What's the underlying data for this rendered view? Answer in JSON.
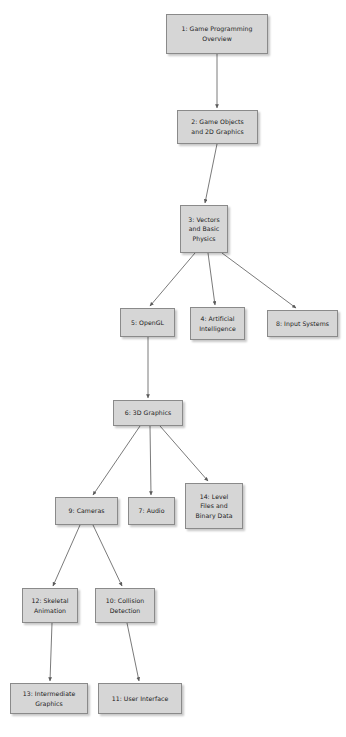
{
  "diagram": {
    "background_color": "#ffffff",
    "node_fill_color": "#d6d6d6",
    "node_border_color": "#8a8a8a",
    "edge_color": "#6b6b6b",
    "text_color": "#1b1b1b",
    "nodes": [
      {
        "id": "n1",
        "label": "1: Game Programming\nOverview",
        "x": 166,
        "y": 14,
        "w": 102,
        "h": 40
      },
      {
        "id": "n2",
        "label": "2: Game Objects\nand 2D Graphics",
        "x": 177,
        "y": 110,
        "w": 81,
        "h": 34
      },
      {
        "id": "n3",
        "label": "3: Vectors\nand Basic\nPhysics",
        "x": 180,
        "y": 205,
        "w": 48,
        "h": 48
      },
      {
        "id": "n4",
        "label": "4: Artificial\nIntelligence",
        "x": 190,
        "y": 307,
        "w": 55,
        "h": 33
      },
      {
        "id": "n5",
        "label": "5: OpenGL",
        "x": 120,
        "y": 308,
        "w": 55,
        "h": 29
      },
      {
        "id": "n8",
        "label": "8: Input Systems",
        "x": 267,
        "y": 310,
        "w": 71,
        "h": 27
      },
      {
        "id": "n6",
        "label": "6: 3D Graphics",
        "x": 113,
        "y": 400,
        "w": 70,
        "h": 26
      },
      {
        "id": "n9",
        "label": "9: Cameras",
        "x": 55,
        "y": 497,
        "w": 63,
        "h": 28
      },
      {
        "id": "n7",
        "label": "7: Audio",
        "x": 128,
        "y": 497,
        "w": 47,
        "h": 28
      },
      {
        "id": "n14",
        "label": "14: Level\nFiles and\nBinary Data",
        "x": 185,
        "y": 483,
        "w": 58,
        "h": 46
      },
      {
        "id": "n12",
        "label": "12: Skeletal\nAnimation",
        "x": 22,
        "y": 588,
        "w": 56,
        "h": 35
      },
      {
        "id": "n10",
        "label": "10: Collision\nDetection",
        "x": 95,
        "y": 588,
        "w": 60,
        "h": 35
      },
      {
        "id": "n13",
        "label": "13: Intermediate\nGraphics",
        "x": 10,
        "y": 683,
        "w": 78,
        "h": 31
      },
      {
        "id": "n11",
        "label": "11: User Interface",
        "x": 98,
        "y": 683,
        "w": 84,
        "h": 31
      }
    ],
    "edges": [
      {
        "from": "n1",
        "to": "n2",
        "x1": 217,
        "y1": 54,
        "x2": 217,
        "y2": 108
      },
      {
        "from": "n2",
        "to": "n3",
        "x1": 217,
        "y1": 144,
        "x2": 205,
        "y2": 203
      },
      {
        "from": "n3",
        "to": "n5",
        "x1": 195,
        "y1": 253,
        "x2": 150,
        "y2": 306
      },
      {
        "from": "n3",
        "to": "n4",
        "x1": 208,
        "y1": 253,
        "x2": 215,
        "y2": 305
      },
      {
        "from": "n3",
        "to": "n8",
        "x1": 222,
        "y1": 253,
        "x2": 296,
        "y2": 308
      },
      {
        "from": "n5",
        "to": "n6",
        "x1": 148,
        "y1": 337,
        "x2": 148,
        "y2": 398
      },
      {
        "from": "n6",
        "to": "n9",
        "x1": 140,
        "y1": 426,
        "x2": 93,
        "y2": 495
      },
      {
        "from": "n6",
        "to": "n7",
        "x1": 150,
        "y1": 426,
        "x2": 151,
        "y2": 495
      },
      {
        "from": "n6",
        "to": "n14",
        "x1": 160,
        "y1": 426,
        "x2": 208,
        "y2": 481
      },
      {
        "from": "n9",
        "to": "n12",
        "x1": 80,
        "y1": 525,
        "x2": 53,
        "y2": 586
      },
      {
        "from": "n9",
        "to": "n10",
        "x1": 93,
        "y1": 525,
        "x2": 122,
        "y2": 586
      },
      {
        "from": "n12",
        "to": "n13",
        "x1": 52,
        "y1": 623,
        "x2": 50,
        "y2": 681
      },
      {
        "from": "n10",
        "to": "n11",
        "x1": 127,
        "y1": 623,
        "x2": 139,
        "y2": 681
      }
    ]
  }
}
